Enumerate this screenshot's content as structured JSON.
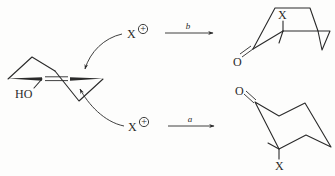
{
  "diagram": {
    "type": "reaction-scheme",
    "reactant": {
      "substituent_label": "HO",
      "description": "enol with exocyclic-like C=C double bond between two ring fragments (wedged bonds)"
    },
    "electrophiles": {
      "top": {
        "symbol": "X",
        "charge": "+"
      },
      "bottom": {
        "symbol": "X",
        "charge": "+"
      }
    },
    "pathways": [
      {
        "label": "b",
        "product": {
          "atoms": [
            "X",
            "O"
          ],
          "description": "boat-like ketone, X axial-up"
        }
      },
      {
        "label": "a",
        "product": {
          "atoms": [
            "O",
            "X"
          ],
          "description": "chair cyclohexanone, X axial-down"
        }
      }
    ],
    "colors": {
      "ink": "#2a2a2a",
      "background": "#fdfdfc"
    }
  }
}
